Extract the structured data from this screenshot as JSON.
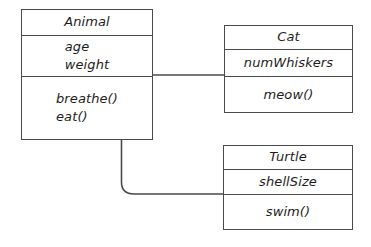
{
  "diagram": {
    "kind": "uml-class-diagram",
    "background_color": "#ffffff",
    "line_color": "#4a4a4a",
    "text_color": "#1d1d1d"
  },
  "classes": {
    "animal": {
      "name": "Animal",
      "attributes": [
        "age",
        "weight"
      ],
      "methods": [
        "breathe()",
        "eat()"
      ]
    },
    "cat": {
      "name": "Cat",
      "attributes": [
        "numWhiskers"
      ],
      "methods": [
        "meow()"
      ]
    },
    "turtle": {
      "name": "Turtle",
      "attributes": [
        "shellSize"
      ],
      "methods": [
        "swim()"
      ]
    }
  },
  "connectors": [
    {
      "id": "animal-to-cat",
      "from": "animal",
      "to": "cat",
      "style": "straight-horizontal"
    },
    {
      "id": "animal-to-turtle",
      "from": "animal",
      "to": "turtle",
      "style": "elbow-rounded"
    }
  ]
}
